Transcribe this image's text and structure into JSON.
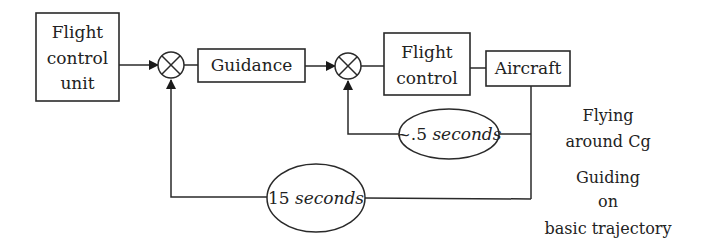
{
  "diagram": {
    "blocks": {
      "flight_control_unit": {
        "line1": "Flight",
        "line2": "control",
        "line3": "unit"
      },
      "guidance": {
        "label": "Guidance"
      },
      "flight_control": {
        "line1": "Flight",
        "line2": "control"
      },
      "aircraft": {
        "label": "Aircraft"
      }
    },
    "loops": {
      "inner": {
        "prefix": "~.5 ",
        "unit": "seconds"
      },
      "outer": {
        "prefix": "15 ",
        "unit": "seconds"
      }
    },
    "annotations": {
      "inner": {
        "line1": "Flying",
        "line2": "around Cg"
      },
      "outer": {
        "line1": "Guiding",
        "line2": "on",
        "line3": "basic trajectory"
      }
    },
    "colors": {
      "stroke": "#2a2a2a",
      "text": "#222222",
      "background": "#ffffff"
    }
  }
}
